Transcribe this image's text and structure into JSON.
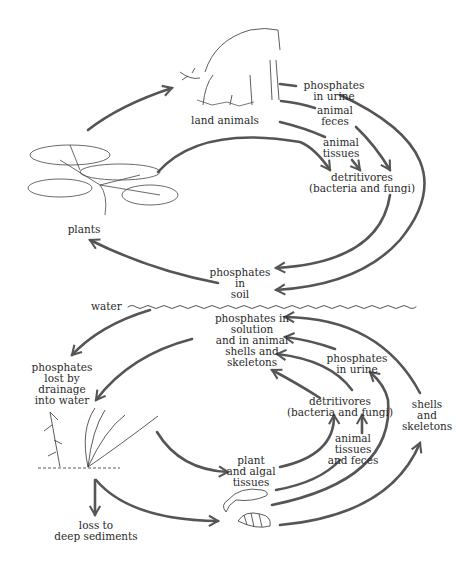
{
  "diagram": {
    "arrow_color": "#555555",
    "land": {
      "nodes": {
        "land_animals": "land animals",
        "plants": "plants",
        "phosphates_in_urine": "phosphates\nin urine",
        "animal_feces": "animal\nfeces",
        "animal_tissues": "animal\ntissues",
        "detritivores": "detritivores\n(bacteria and fungi)",
        "phosphates_in_soil": "phosphates\nin\nsoil"
      }
    },
    "boundary": {
      "water_label": "water"
    },
    "water": {
      "nodes": {
        "phosphates_in_solution": "phosphates in\nsolution\nand in animal\nshells and\nskeletons",
        "phosphates_lost_by_drainage": "phosphates\nlost by\ndrainage\ninto water",
        "phosphates_in_urine": "phosphates\nin urine",
        "detritivores": "detritivores\n(bacteria and fungi)",
        "shells_and_skeletons": "shells\nand\nskeletons",
        "animal_tissues_and_feces": "animal\ntissues\nand feces",
        "plant_and_algal_tissues": "plant\nand algal\ntissues",
        "loss_to_deep_sediments": "loss to\ndeep sediments"
      }
    },
    "illustrations": [
      "deer-icon",
      "pine-tree-icon",
      "aquatic-plants-icon",
      "fish-icon",
      "snail-shell-icon"
    ]
  }
}
